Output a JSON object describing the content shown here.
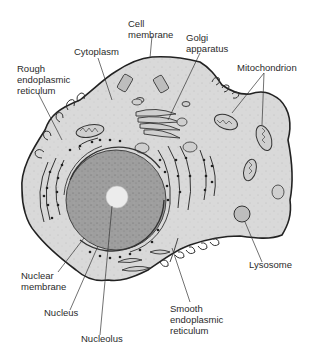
{
  "diagram": {
    "colors": {
      "background": "#ffffff",
      "cytoplasm": "#d9d9d9",
      "nucleus": "#9e9e9e",
      "nucleolus": "#ececec",
      "outline": "#222222",
      "label_text": "#2a2a2a"
    },
    "labels": {
      "cell_membrane": {
        "line1": "Cell",
        "line2": "membrane"
      },
      "cytoplasm": {
        "line1": "Cytoplasm"
      },
      "golgi": {
        "line1": "Golgi",
        "line2": "apparatus"
      },
      "rough_er": {
        "line1": "Rough",
        "line2": "endoplasmic",
        "line3": "reticulum"
      },
      "mitochondrion": {
        "line1": "Mitochondrion"
      },
      "lysosome": {
        "line1": "Lysosome"
      },
      "nuclear_membrane": {
        "line1": "Nuclear",
        "line2": "membrane"
      },
      "nucleus": {
        "line1": "Nucleus"
      },
      "nucleolus": {
        "line1": "Nucleolus"
      },
      "smooth_er": {
        "line1": "Smooth",
        "line2": "endoplasmic",
        "line3": "reticulum"
      }
    }
  }
}
